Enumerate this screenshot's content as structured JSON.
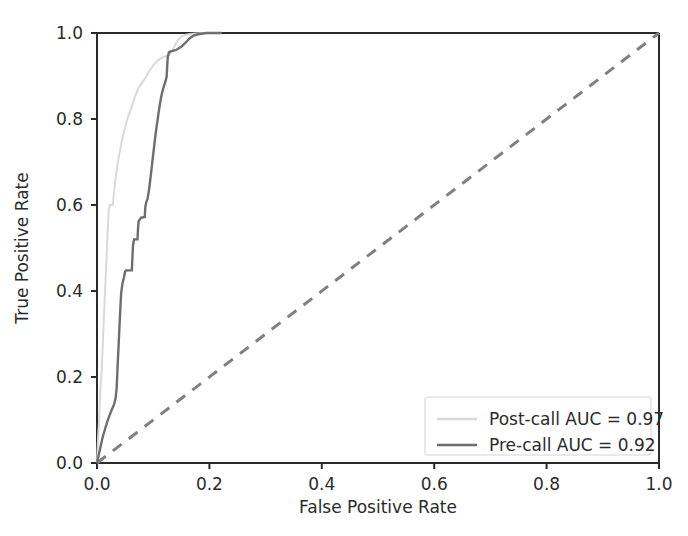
{
  "chart_data": {
    "type": "line",
    "title": "",
    "xlabel": "False Positive Rate",
    "ylabel": "True Positive Rate",
    "xlim": [
      0.0,
      1.0
    ],
    "ylim": [
      0.0,
      1.0
    ],
    "xticks": [
      "0.0",
      "0.2",
      "0.4",
      "0.6",
      "0.8",
      "1.0"
    ],
    "yticks": [
      "0.0",
      "0.2",
      "0.4",
      "0.6",
      "0.8",
      "1.0"
    ],
    "xtick_values": [
      0.0,
      0.2,
      0.4,
      0.6,
      0.8,
      1.0
    ],
    "ytick_values": [
      0.0,
      0.2,
      0.4,
      0.6,
      0.8,
      1.0
    ],
    "grid": false,
    "legend_position": "lower right",
    "series": [
      {
        "name": "Post-call AUC = 0.97",
        "color": "#d9d9d9",
        "linestyle": "solid",
        "linewidth": 2,
        "auc": 0.97,
        "points": [
          [
            0.0,
            0.0
          ],
          [
            0.002,
            0.06
          ],
          [
            0.004,
            0.105
          ],
          [
            0.005,
            0.14
          ],
          [
            0.006,
            0.175
          ],
          [
            0.008,
            0.205
          ],
          [
            0.009,
            0.235
          ],
          [
            0.01,
            0.265
          ],
          [
            0.011,
            0.3
          ],
          [
            0.012,
            0.33
          ],
          [
            0.013,
            0.36
          ],
          [
            0.014,
            0.39
          ],
          [
            0.015,
            0.42
          ],
          [
            0.016,
            0.45
          ],
          [
            0.017,
            0.48
          ],
          [
            0.018,
            0.51
          ],
          [
            0.019,
            0.54
          ],
          [
            0.02,
            0.565
          ],
          [
            0.021,
            0.59
          ],
          [
            0.023,
            0.6
          ],
          [
            0.028,
            0.6
          ],
          [
            0.03,
            0.625
          ],
          [
            0.032,
            0.65
          ],
          [
            0.034,
            0.672
          ],
          [
            0.036,
            0.69
          ],
          [
            0.038,
            0.705
          ],
          [
            0.04,
            0.72
          ],
          [
            0.043,
            0.74
          ],
          [
            0.046,
            0.76
          ],
          [
            0.05,
            0.78
          ],
          [
            0.054,
            0.8
          ],
          [
            0.058,
            0.815
          ],
          [
            0.062,
            0.83
          ],
          [
            0.066,
            0.845
          ],
          [
            0.07,
            0.86
          ],
          [
            0.074,
            0.872
          ],
          [
            0.078,
            0.88
          ],
          [
            0.082,
            0.888
          ],
          [
            0.086,
            0.895
          ],
          [
            0.09,
            0.905
          ],
          [
            0.095,
            0.915
          ],
          [
            0.1,
            0.925
          ],
          [
            0.105,
            0.932
          ],
          [
            0.11,
            0.938
          ],
          [
            0.115,
            0.942
          ],
          [
            0.12,
            0.945
          ],
          [
            0.128,
            0.948
          ],
          [
            0.135,
            0.96
          ],
          [
            0.14,
            0.975
          ],
          [
            0.145,
            0.985
          ],
          [
            0.15,
            0.992
          ],
          [
            0.158,
            0.996
          ],
          [
            0.17,
            0.998
          ],
          [
            0.19,
            1.0
          ],
          [
            0.22,
            1.0
          ]
        ]
      },
      {
        "name": "Pre-call AUC = 0.92",
        "color": "#6e6e6e",
        "linestyle": "solid",
        "linewidth": 2.4,
        "auc": 0.92,
        "points": [
          [
            0.0,
            0.0
          ],
          [
            0.01,
            0.06
          ],
          [
            0.018,
            0.095
          ],
          [
            0.025,
            0.12
          ],
          [
            0.03,
            0.135
          ],
          [
            0.033,
            0.15
          ],
          [
            0.035,
            0.175
          ],
          [
            0.036,
            0.205
          ],
          [
            0.037,
            0.235
          ],
          [
            0.038,
            0.262
          ],
          [
            0.039,
            0.29
          ],
          [
            0.04,
            0.318
          ],
          [
            0.041,
            0.345
          ],
          [
            0.042,
            0.37
          ],
          [
            0.043,
            0.395
          ],
          [
            0.045,
            0.415
          ],
          [
            0.048,
            0.432
          ],
          [
            0.05,
            0.445
          ],
          [
            0.052,
            0.448
          ],
          [
            0.062,
            0.448
          ],
          [
            0.063,
            0.478
          ],
          [
            0.064,
            0.505
          ],
          [
            0.066,
            0.52
          ],
          [
            0.072,
            0.52
          ],
          [
            0.073,
            0.545
          ],
          [
            0.074,
            0.562
          ],
          [
            0.078,
            0.57
          ],
          [
            0.085,
            0.572
          ],
          [
            0.086,
            0.596
          ],
          [
            0.088,
            0.608
          ],
          [
            0.09,
            0.615
          ],
          [
            0.092,
            0.63
          ],
          [
            0.094,
            0.65
          ],
          [
            0.096,
            0.672
          ],
          [
            0.098,
            0.695
          ],
          [
            0.1,
            0.718
          ],
          [
            0.102,
            0.74
          ],
          [
            0.104,
            0.762
          ],
          [
            0.106,
            0.782
          ],
          [
            0.108,
            0.8
          ],
          [
            0.11,
            0.818
          ],
          [
            0.112,
            0.835
          ],
          [
            0.114,
            0.85
          ],
          [
            0.116,
            0.862
          ],
          [
            0.118,
            0.872
          ],
          [
            0.12,
            0.88
          ],
          [
            0.122,
            0.888
          ],
          [
            0.124,
            0.9
          ],
          [
            0.125,
            0.925
          ],
          [
            0.126,
            0.945
          ],
          [
            0.128,
            0.955
          ],
          [
            0.132,
            0.958
          ],
          [
            0.14,
            0.96
          ],
          [
            0.15,
            0.968
          ],
          [
            0.158,
            0.978
          ],
          [
            0.165,
            0.988
          ],
          [
            0.172,
            0.994
          ],
          [
            0.18,
            0.997
          ],
          [
            0.195,
            1.0
          ],
          [
            0.222,
            1.0
          ]
        ]
      }
    ],
    "reference_line": {
      "name": "chance-diagonal",
      "color": "#808080",
      "linestyle": "dashed",
      "points": [
        [
          0.0,
          0.0
        ],
        [
          1.0,
          1.0
        ]
      ]
    }
  },
  "legend": {
    "entries": [
      {
        "label": "Post-call AUC = 0.97",
        "color": "#d9d9d9"
      },
      {
        "label": "Pre-call AUC = 0.92",
        "color": "#6e6e6e"
      }
    ]
  },
  "colors": {
    "axis": "#2b2b2b",
    "text": "#2b2b2b",
    "background": "#ffffff",
    "legend_border": "#e2e2e2",
    "post_call": "#d9d9d9",
    "pre_call": "#6e6e6e",
    "diagonal": "#808080"
  }
}
